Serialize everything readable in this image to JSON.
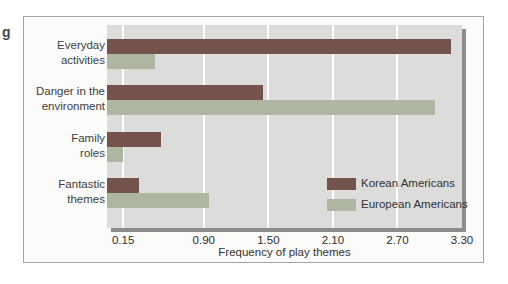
{
  "caption_fragment": "g",
  "chart_data": {
    "type": "bar",
    "orientation": "horizontal",
    "title": "",
    "xlabel": "Frequency of play themes",
    "xlim": [
      0,
      3.3
    ],
    "xticks": [
      0.15,
      0.9,
      1.5,
      2.1,
      2.7,
      3.3
    ],
    "xtick_labels": [
      "0.15",
      "0.90",
      "1.50",
      "2.10",
      "2.70",
      "3.30"
    ],
    "grid": "white vertical gridlines on",
    "legend_position": "inside bottom-right",
    "categories": [
      {
        "line1": "Everyday",
        "line2": "activities"
      },
      {
        "line1": "Danger in the",
        "line2": "environment"
      },
      {
        "line1": "Family",
        "line2": "roles"
      },
      {
        "line1": "Fantastic",
        "line2": "themes"
      }
    ],
    "series": [
      {
        "name": "Korean Americans",
        "color": "#74534c",
        "values": [
          3.2,
          1.45,
          0.5,
          0.3
        ]
      },
      {
        "name": "European Americans",
        "color": "#aeb5a0",
        "values": [
          0.45,
          3.05,
          0.15,
          0.95
        ]
      }
    ],
    "colors": {
      "plot_background": "#dcdcda",
      "plot_shadow": "#8d8d8d",
      "card_border": "#a3a3a3",
      "text": "#3d3d3d"
    }
  }
}
